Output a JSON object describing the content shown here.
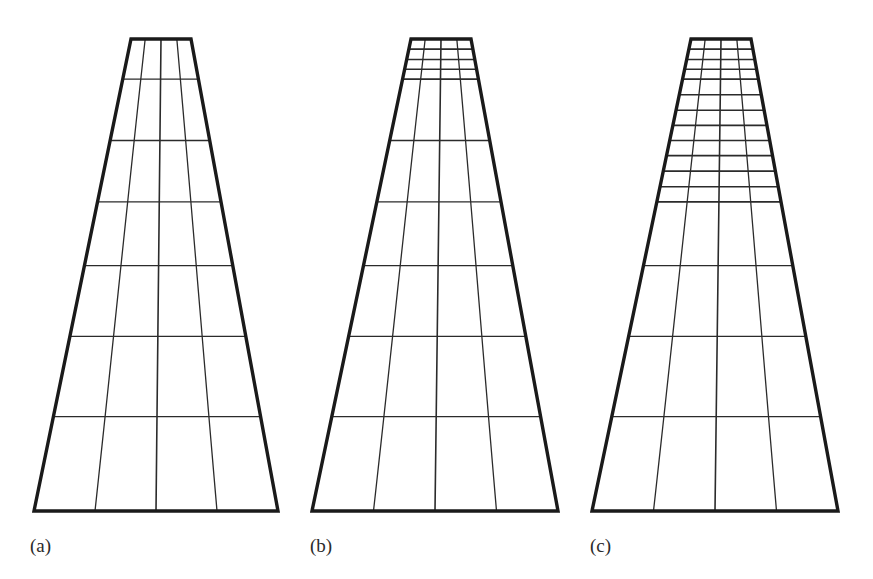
{
  "figure": {
    "kind": "mesh-refinement-figure",
    "background_color": "#ffffff",
    "line_color": "#2b2b2b",
    "outline_color": "#1a1a1a",
    "outline_width": 3.4,
    "grid_width": 1.3,
    "refined_grid_width": 1.6,
    "width": 873,
    "height": 579
  },
  "panels": [
    {
      "id": "panel-a",
      "caption": "(a)",
      "caption_x": 30,
      "caption_y": 552,
      "geometry": {
        "top_y": 39,
        "bottom_y": 511,
        "top_left_x": 131,
        "top_right_x": 191,
        "bottom_left_x": 34,
        "bottom_right_x": 278
      },
      "columns": 4,
      "row_count": 7,
      "row_fractions": [
        0.0,
        0.085,
        0.215,
        0.345,
        0.48,
        0.63,
        0.8,
        1.0
      ],
      "refinement_level": 0,
      "refined_rows": 0
    },
    {
      "id": "panel-b",
      "caption": "(b)",
      "caption_x": 310,
      "caption_y": 552,
      "geometry": {
        "top_y": 39,
        "bottom_y": 511,
        "top_left_x": 411,
        "top_right_x": 471,
        "bottom_left_x": 312,
        "bottom_right_x": 558
      },
      "columns": 4,
      "row_count": 11,
      "row_fractions": [
        0.0,
        0.0215,
        0.0435,
        0.064,
        0.085,
        0.215,
        0.345,
        0.48,
        0.63,
        0.8,
        1.0
      ],
      "refinement_level": 1,
      "refined_rows": 4,
      "refined_band_fraction": 0.085
    },
    {
      "id": "panel-c",
      "caption": "(c)",
      "caption_x": 590,
      "caption_y": 552,
      "geometry": {
        "top_y": 39,
        "bottom_y": 511,
        "top_left_x": 691,
        "top_right_x": 751,
        "bottom_left_x": 592,
        "bottom_right_x": 838
      },
      "columns": 4,
      "row_count": 17,
      "row_fractions": [
        0.0,
        0.0215,
        0.0435,
        0.064,
        0.085,
        0.118,
        0.151,
        0.183,
        0.215,
        0.247,
        0.28,
        0.313,
        0.345,
        0.48,
        0.63,
        0.8,
        1.0
      ],
      "refinement_level": 2,
      "refined_rows": 10,
      "refined_band_fraction": 0.345
    }
  ],
  "captions": {
    "a": "(a)",
    "b": "(b)",
    "c": "(c)"
  }
}
